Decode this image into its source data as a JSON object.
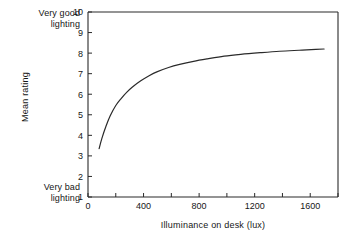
{
  "annotations": {
    "top_left": "Very good\nlighting",
    "bottom_left": "Very bad\nlighting"
  },
  "chart_data": {
    "type": "line",
    "title": "",
    "xlabel": "Illuminance on desk (lux)",
    "ylabel": "Mean rating",
    "xlim": [
      0,
      1800
    ],
    "ylim": [
      1,
      10
    ],
    "grid": false,
    "legend": null,
    "xticks": [
      0,
      200,
      400,
      600,
      800,
      1000,
      1200,
      1400,
      1600,
      1800
    ],
    "xticklabels": [
      "0",
      "",
      "400",
      "",
      "800",
      "",
      "1200",
      "",
      "1600",
      ""
    ],
    "yticks": [
      1,
      2,
      3,
      4,
      5,
      6,
      7,
      8,
      9,
      10
    ],
    "yticklabels": [
      "1",
      "2",
      "3",
      "4",
      "5",
      "6",
      "7",
      "8",
      "9",
      "10"
    ],
    "series": [
      {
        "name": "Mean rating vs illuminance",
        "x": [
          80,
          100,
          130,
          160,
          200,
          240,
          280,
          320,
          380,
          440,
          500,
          580,
          660,
          760,
          860,
          980,
          1100,
          1240,
          1380,
          1520,
          1640,
          1700
        ],
        "y": [
          3.35,
          3.85,
          4.45,
          4.95,
          5.45,
          5.8,
          6.1,
          6.35,
          6.65,
          6.9,
          7.1,
          7.3,
          7.45,
          7.6,
          7.72,
          7.85,
          7.94,
          8.02,
          8.09,
          8.14,
          8.18,
          8.2
        ]
      }
    ],
    "colors": {
      "axis": "#2a2a2a",
      "curve": "#2a2a2a",
      "background": "#ffffff"
    }
  },
  "axes_geometry": {
    "plot_left_px": 88,
    "plot_right_px": 338,
    "plot_top_px": 12,
    "plot_bottom_px": 197
  }
}
